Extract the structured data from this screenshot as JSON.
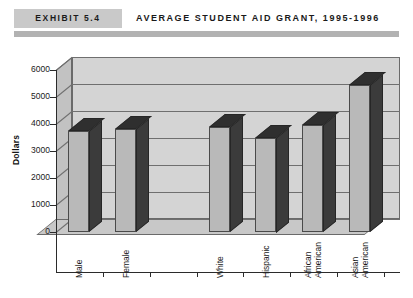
{
  "header": {
    "exhibit_label": "EXHIBIT 5.4",
    "title": "AVERAGE STUDENT AID GRANT, 1995-1996"
  },
  "chart_data": {
    "type": "bar",
    "title": "AVERAGE STUDENT AID GRANT, 1995-1996",
    "xlabel": "",
    "ylabel": "Dollars",
    "ylim": [
      0,
      6000
    ],
    "ytick_labels": [
      "0",
      "1000",
      "2000",
      "3000",
      "4000",
      "5000",
      "6000"
    ],
    "ytick_values": [
      0,
      1000,
      2000,
      3000,
      4000,
      5000,
      6000
    ],
    "grid": true,
    "legend": "none",
    "three_d": true,
    "categories": [
      "Male",
      "Female",
      "",
      "White",
      "Hispanic",
      "African American",
      "Asian American"
    ],
    "values": [
      3750,
      3800,
      null,
      3900,
      3500,
      3950,
      5450
    ],
    "bars": [
      {
        "label": "Male",
        "label_lines": [
          "Male"
        ],
        "value": 3750
      },
      {
        "label": "Female",
        "label_lines": [
          "Female"
        ],
        "value": 3800
      },
      {
        "label": "",
        "label_lines": [],
        "value": null
      },
      {
        "label": "White",
        "label_lines": [
          "White"
        ],
        "value": 3900
      },
      {
        "label": "Hispanic",
        "label_lines": [
          "Hispanic"
        ],
        "value": 3500
      },
      {
        "label": "African American",
        "label_lines": [
          "African",
          "American"
        ],
        "value": 3950
      },
      {
        "label": "Asian American",
        "label_lines": [
          "Asian",
          "American"
        ],
        "value": 5450
      }
    ],
    "colors": {
      "bar_face": "#b9b9b9",
      "bar_side": "#3b3b3b",
      "bar_top": "#2f2f2f",
      "wall": "#d4d4d4",
      "floor": "#c8c8c8",
      "gridline": "#6f6f6f",
      "axis": "#2b2b2b",
      "exhibit_box": "#c9c9c9",
      "header_rule": "#b2b2b2"
    }
  }
}
